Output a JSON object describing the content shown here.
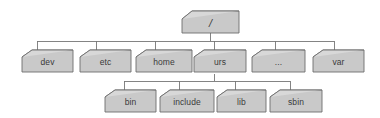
{
  "diagram": {
    "kind": "filesystem-hierarchy-tree",
    "background_color": "#ffffff",
    "node_fill_color": "#c9c9c9",
    "node_top_face_color": "#d8d8d8",
    "node_border_color": "#6e6e6e",
    "connector_color": "#777777",
    "label_color": "#3a3a3a",
    "levels": 3,
    "node_count": 11
  },
  "nodes": {
    "root": {
      "label": "/",
      "level": 0
    },
    "level1": [
      {
        "label": "dev",
        "level": 1
      },
      {
        "label": "etc",
        "level": 1
      },
      {
        "label": "home",
        "level": 1
      },
      {
        "label": "urs",
        "level": 1
      },
      {
        "label": "...",
        "level": 1
      },
      {
        "label": "var",
        "level": 1
      }
    ],
    "level2": [
      {
        "label": "bin",
        "level": 2
      },
      {
        "label": "include",
        "level": 2
      },
      {
        "label": "lib",
        "level": 2
      },
      {
        "label": "sbin",
        "level": 2
      }
    ]
  }
}
